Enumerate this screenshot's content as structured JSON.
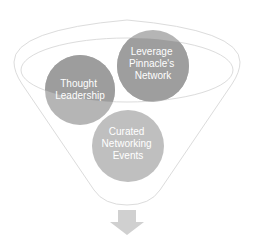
{
  "diagram": {
    "type": "funnel",
    "items": [
      {
        "label_lines": [
          "Thought",
          "Leadership"
        ]
      },
      {
        "label_lines": [
          "Leverage",
          "Pinnacle's",
          "Network"
        ]
      },
      {
        "label_lines": [
          "Curated",
          "Networking",
          "Events"
        ]
      }
    ],
    "colors": {
      "funnel_outline": "#d9d9d9",
      "circle_dark": "#9e9e9e",
      "circle_mid": "#b3b3b3",
      "circle_light": "#bfbfbf",
      "arrow": "#d0d0d0"
    }
  }
}
